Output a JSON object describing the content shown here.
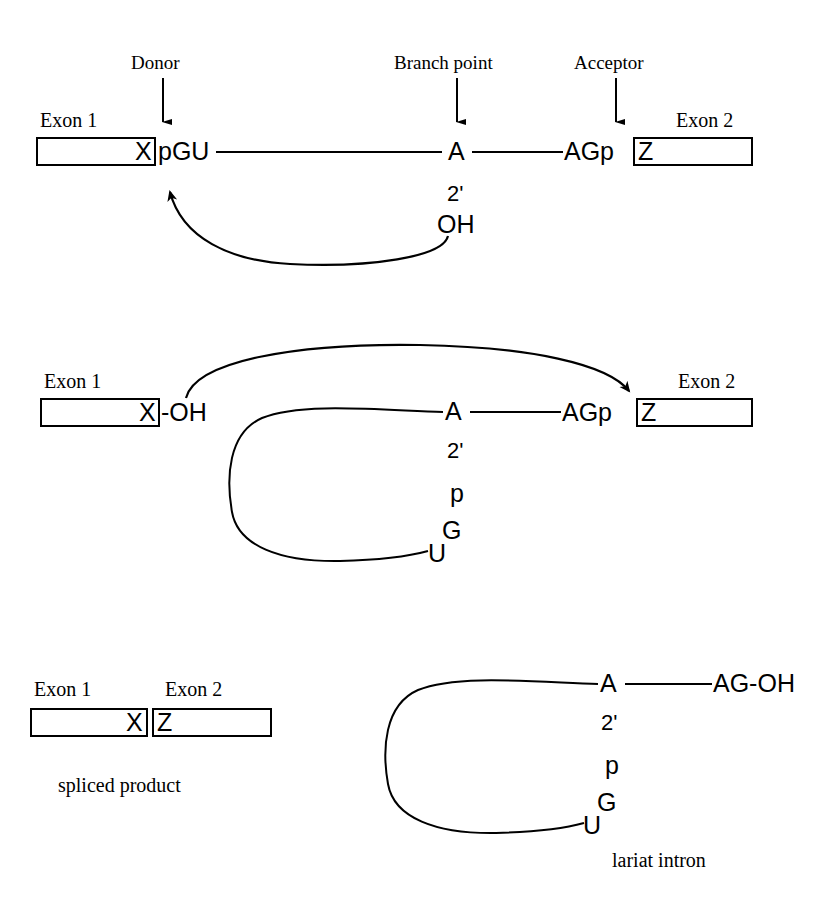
{
  "figure": {
    "line_color": "#000000",
    "background_color": "#ffffff"
  },
  "panel1": {
    "annotations": {
      "donor": "Donor",
      "branch_point": "Branch point",
      "acceptor": "Acceptor"
    },
    "exon1_label": "Exon 1",
    "exon2_label": "Exon 2",
    "exon1_letter": "X",
    "exon2_letter": "Z",
    "donor_site": "pGU",
    "acceptor_site": "AGp",
    "branch_a": "A",
    "branch_prime": "2'",
    "branch_oh": "OH"
  },
  "panel2": {
    "exon1_label": "Exon 1",
    "exon2_label": "Exon 2",
    "exon1_letter": "X",
    "exon2_letter": "Z",
    "exon1_oh": "-OH",
    "acceptor_site": "AGp",
    "branch_a": "A",
    "branch_prime": "2'",
    "branch_p": "p",
    "branch_g": "G",
    "branch_u": "U"
  },
  "panel3": {
    "exon1_label": "Exon 1",
    "exon2_label": "Exon 2",
    "exon1_letter": "X",
    "exon2_letter": "Z",
    "spliced_caption": "spliced product",
    "lariat_caption": "lariat intron",
    "branch_a": "A",
    "branch_prime": "2'",
    "branch_p": "p",
    "branch_g": "G",
    "branch_u": "U",
    "intron_3end": "AG-OH"
  }
}
